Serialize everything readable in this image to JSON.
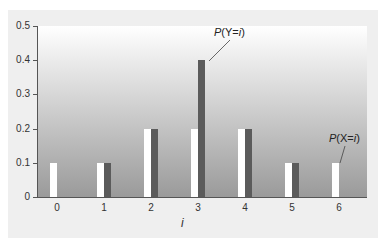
{
  "chart_data": {
    "type": "bar",
    "title": "",
    "xlabel": "i",
    "ylabel": "",
    "categories": [
      "0",
      "1",
      "2",
      "3",
      "4",
      "5",
      "6"
    ],
    "series": [
      {
        "name": "P(X=i)",
        "color": "#ffffff",
        "values": [
          0.1,
          0.1,
          0.2,
          0.2,
          0.2,
          0.1,
          0.1
        ]
      },
      {
        "name": "P(Y=i)",
        "color": "#5b5b5b",
        "values": [
          0.0,
          0.1,
          0.2,
          0.4,
          0.2,
          0.1,
          0.0
        ]
      }
    ],
    "ylim": [
      0,
      0.5
    ],
    "yticks": [
      "0",
      "0.1",
      "0.2",
      "0.3",
      "0.4",
      "0.5"
    ],
    "grid": false,
    "annotations": [
      {
        "text": "P(Y=i)",
        "points_to": "series Y at i=3"
      },
      {
        "text": "P(X=i)",
        "points_to": "series X at i=6"
      }
    ]
  },
  "labels": {
    "ann_y": {
      "p": "P",
      "rest": "(Y=",
      "i": "i",
      "close": ")"
    },
    "ann_x": {
      "p": "P",
      "rest": "(X=",
      "i": "i",
      "close": ")"
    },
    "axis_title": "i"
  }
}
